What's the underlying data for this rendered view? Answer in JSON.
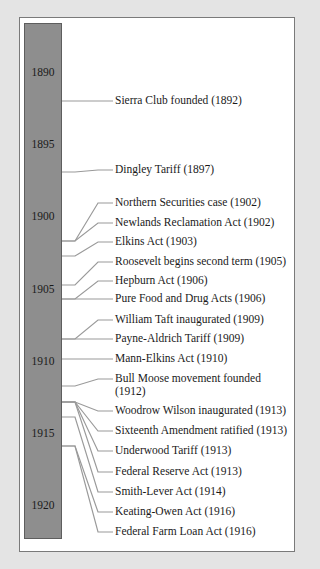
{
  "timeline": {
    "start_year": 1890,
    "end_year": 1920,
    "bar_color": "#8e8e8e",
    "year_labels": [
      {
        "label": "1890",
        "y": 72
      },
      {
        "label": "1895",
        "y": 144
      },
      {
        "label": "1900",
        "y": 216
      },
      {
        "label": "1905",
        "y": 289
      },
      {
        "label": "1910",
        "y": 361
      },
      {
        "label": "1915",
        "y": 433
      },
      {
        "label": "1920",
        "y": 505
      }
    ],
    "events": [
      {
        "text": "Sierra Club founded (1892)",
        "year": 1892,
        "anchor_y": 101,
        "label_y": 101
      },
      {
        "text": "Dingley Tariff (1897)",
        "year": 1897,
        "anchor_y": 172,
        "label_y": 170
      },
      {
        "text": "Northern Securities case (1902)",
        "year": 1902,
        "anchor_y": 241,
        "label_y": 203
      },
      {
        "text": "Newlands Reclamation Act (1902)",
        "year": 1902,
        "anchor_y": 241,
        "label_y": 223
      },
      {
        "text": "Elkins Act (1903)",
        "year": 1903,
        "anchor_y": 256,
        "label_y": 242
      },
      {
        "text": "Roosevelt begins second term (1905)",
        "year": 1905,
        "anchor_y": 285,
        "label_y": 262
      },
      {
        "text": "Hepburn Act (1906)",
        "year": 1906,
        "anchor_y": 299,
        "label_y": 281
      },
      {
        "text": "Pure Food and Drug Acts (1906)",
        "year": 1906,
        "anchor_y": 299,
        "label_y": 299
      },
      {
        "text": "William Taft inaugurated (1909)",
        "year": 1909,
        "anchor_y": 339,
        "label_y": 320
      },
      {
        "text": "Payne-Aldrich Tariff (1909)",
        "year": 1909,
        "anchor_y": 339,
        "label_y": 339
      },
      {
        "text": "Mann-Elkins Act (1910)",
        "year": 1910,
        "anchor_y": 359,
        "label_y": 359
      },
      {
        "text": "Bull Moose movement founded (1912)",
        "year": 1912,
        "anchor_y": 386,
        "label_y": 379,
        "wrap": true
      },
      {
        "text": "Woodrow Wilson inaugurated (1913)",
        "year": 1913,
        "anchor_y": 402,
        "label_y": 411
      },
      {
        "text": "Sixteenth Amendment ratified (1913)",
        "year": 1913,
        "anchor_y": 402,
        "label_y": 431
      },
      {
        "text": "Underwood Tariff (1913)",
        "year": 1913,
        "anchor_y": 402,
        "label_y": 451
      },
      {
        "text": "Federal Reserve Act (1913)",
        "year": 1913,
        "anchor_y": 402,
        "label_y": 472
      },
      {
        "text": "Smith-Lever Act (1914)",
        "year": 1914,
        "anchor_y": 417,
        "label_y": 492
      },
      {
        "text": "Keating-Owen Act (1916)",
        "year": 1916,
        "anchor_y": 446,
        "label_y": 512
      },
      {
        "text": "Federal Farm Loan Act (1916)",
        "year": 1916,
        "anchor_y": 446,
        "label_y": 532
      }
    ]
  },
  "colors": {
    "background": "#e4e4e4",
    "panel": "#ffffff",
    "bar": "#8e8e8e",
    "connector": "#9a9a9a",
    "text": "#1a1a1a"
  }
}
